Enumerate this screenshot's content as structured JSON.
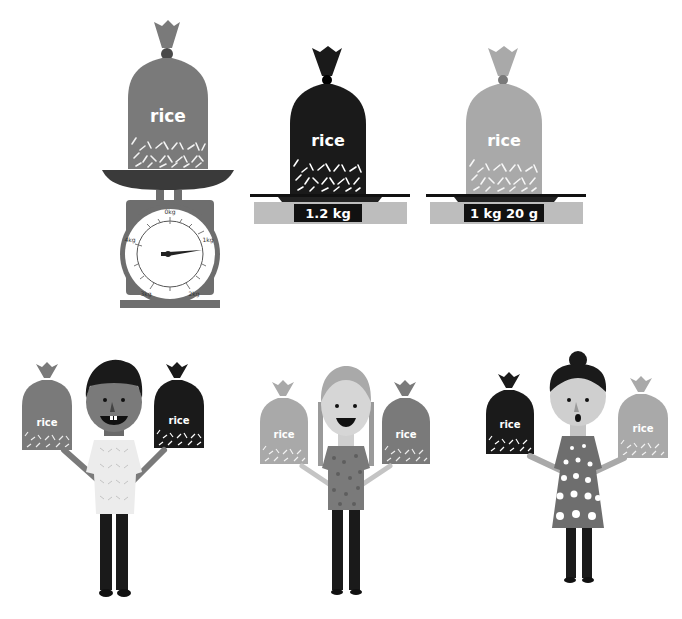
{
  "scene": {
    "description": "Comparing weights of rice bags",
    "colors": {
      "bag_medium": "#7a7a7a",
      "bag_dark": "#1a1a1a",
      "bag_light": "#a9a9a9",
      "scale_gray": "#6e6e6e",
      "platform_light": "#bdbdbd",
      "display_black": "#111111"
    }
  },
  "dial_scale": {
    "bag_label": "rice",
    "dial_labels": {
      "top": "0kg",
      "right": "1kg",
      "bottom_right": "2kg",
      "bottom_left": "3kg",
      "left": "4kg"
    },
    "needle_reading": "≈1kg"
  },
  "digital_scales": [
    {
      "bag_label": "rice",
      "display": "1.2 kg",
      "bag_shade": "dark"
    },
    {
      "bag_label": "rice",
      "display": "1 kg 20 g",
      "bag_shade": "light"
    }
  ],
  "people": [
    {
      "name": "boy",
      "left_bag_label": "rice",
      "right_bag_label": "rice",
      "left_bag_shade": "medium",
      "right_bag_shade": "dark"
    },
    {
      "name": "girl-with-braids",
      "left_bag_label": "rice",
      "right_bag_label": "rice",
      "left_bag_shade": "light",
      "right_bag_shade": "medium"
    },
    {
      "name": "woman-with-bun",
      "left_bag_label": "rice",
      "right_bag_label": "rice",
      "left_bag_shade": "dark",
      "right_bag_shade": "light"
    }
  ]
}
